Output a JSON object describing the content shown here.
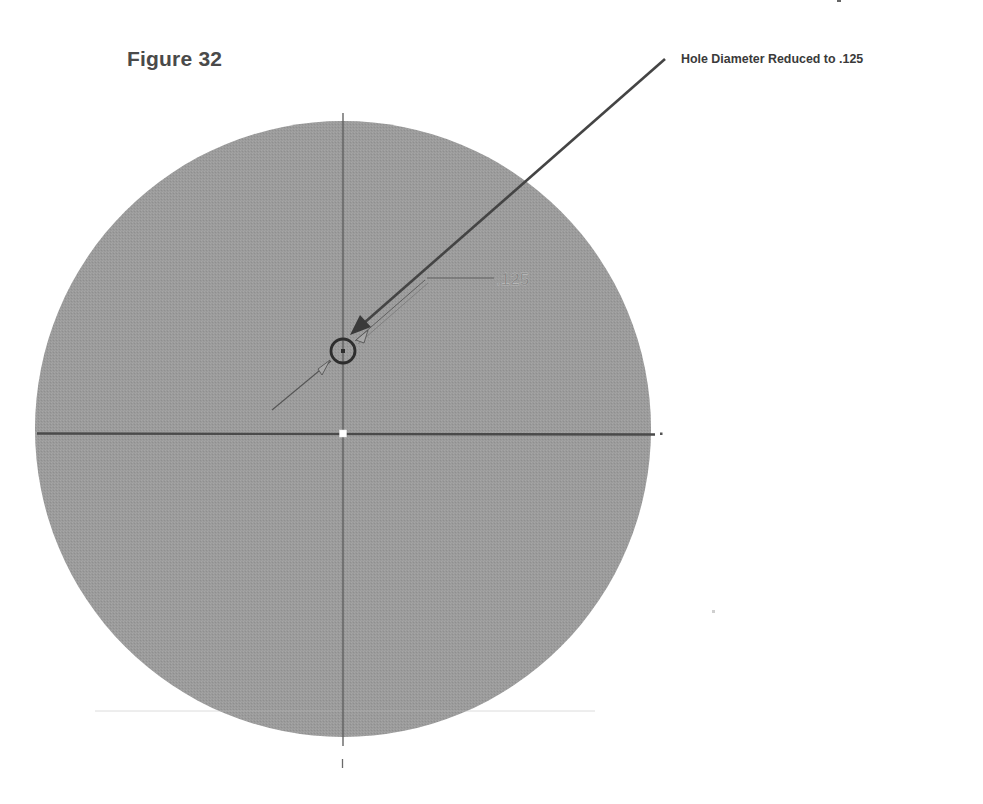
{
  "figure": {
    "title": "Figure 32",
    "callout": {
      "label": "Hole Diameter Reduced to .125"
    },
    "sketch": {
      "dimension_text": ".125",
      "part_shape": "circle",
      "hole_shape": "circle",
      "colors": {
        "part_fill": "#9a9a9a",
        "centerline": "#5a5a5a",
        "horizontal_axis": "#4a4a4a",
        "callout_arrow": "#444444",
        "hole_outline": "#2e2e2e",
        "background": "#ffffff"
      }
    }
  }
}
